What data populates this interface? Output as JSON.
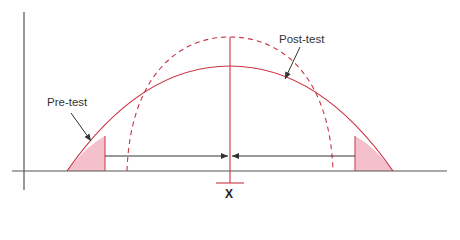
{
  "figure": {
    "labels": {
      "pre_test": "Pre-test",
      "post_test": "Post-test",
      "x_axis_marker": "X"
    },
    "colors": {
      "axis": "#555555",
      "curve": "#cc3344",
      "shade": "#f4c0cc",
      "arrow": "#333333",
      "text": "#333333"
    },
    "curves": [
      {
        "name": "Pre-test",
        "style": "solid",
        "relative_width": "wide",
        "relative_height": "lower"
      },
      {
        "name": "Post-test",
        "style": "dashed",
        "relative_width": "narrow",
        "relative_height": "taller"
      }
    ],
    "annotations": {
      "center_line": "mean marker at X",
      "shaded_tails": "pre-test tails outside arrows",
      "arrows": "tails shift inward toward X"
    }
  }
}
